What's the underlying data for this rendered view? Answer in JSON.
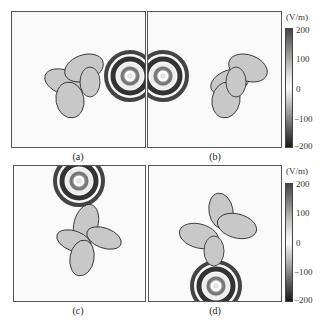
{
  "figure": {
    "panels": [
      {
        "id": "a",
        "label": "(a)",
        "source_position": "right of object",
        "source_xy_px": [
          129,
          75
        ]
      },
      {
        "id": "b",
        "label": "(b)",
        "source_position": "left of object",
        "source_xy_px": [
          162,
          75
        ]
      },
      {
        "id": "c",
        "label": "(c)",
        "source_position": "above object",
        "source_xy_px": [
          78,
          180
        ]
      },
      {
        "id": "d",
        "label": "(d)",
        "source_position": "below object",
        "source_xy_px": [
          215,
          285
        ]
      }
    ],
    "colorbars": [
      {
        "unit": "(V/m)",
        "ticks": [
          "200",
          "100",
          "0",
          "−100",
          "−200"
        ]
      },
      {
        "unit": "(V/m)",
        "ticks": [
          "200",
          "100",
          "0",
          "−100",
          "−200"
        ]
      }
    ],
    "colors": {
      "dark": "#1a1a1a",
      "mid": "#a9a9a9",
      "light": "#fafafa"
    }
  }
}
